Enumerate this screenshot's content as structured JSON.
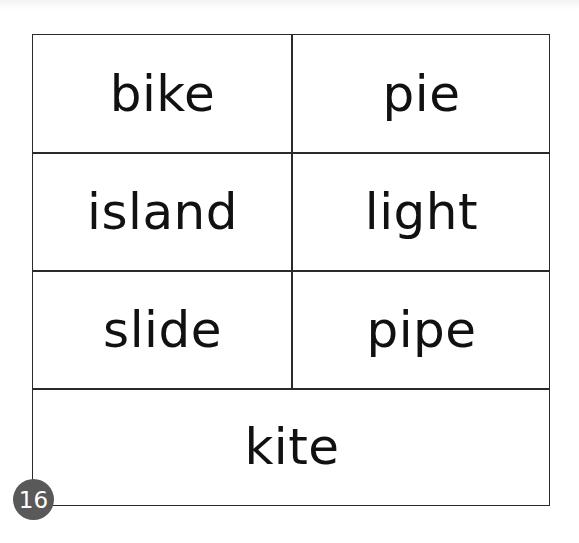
{
  "word_table": {
    "rows": [
      [
        "bike",
        "pie"
      ],
      [
        "island",
        "light"
      ],
      [
        "slide",
        "pipe"
      ],
      [
        "kite"
      ]
    ]
  },
  "page_number": "16",
  "colors": {
    "border": "#2a2a2a",
    "text": "#111111",
    "badge_bg": "#595959",
    "badge_text": "#ffffff"
  }
}
